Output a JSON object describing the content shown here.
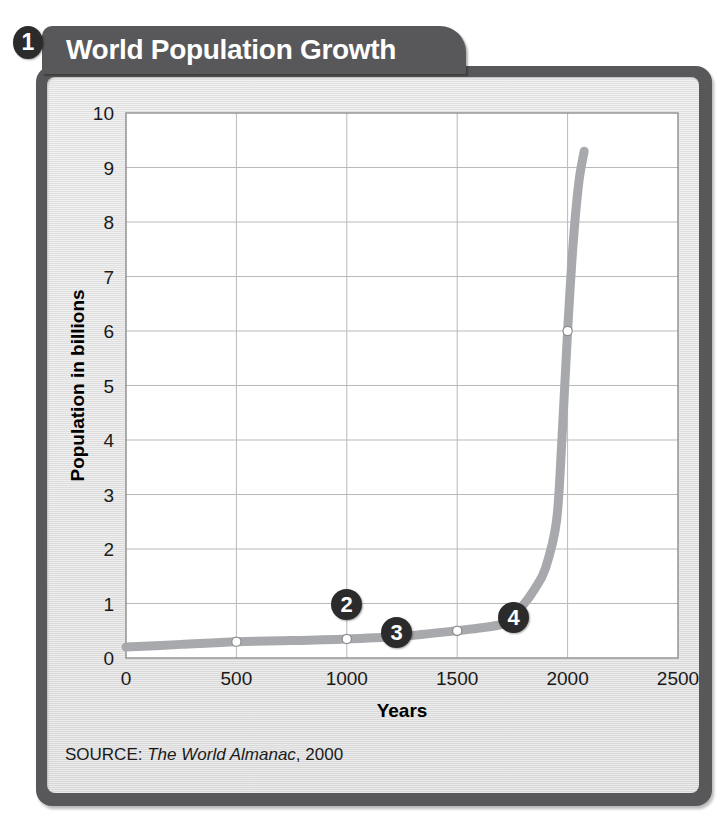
{
  "figure": {
    "number_badge": "1",
    "title": "World Population Growth",
    "source_prefix": "SOURCE:",
    "source_title": "The World Almanac",
    "source_year": "2000",
    "colors": {
      "tab_background": "#58585a",
      "card_border": "#58585a",
      "card_fill": "#e4e4e4",
      "plot_fill": "#ffffff",
      "grid": "#b9b9b9",
      "line": "#a7a9ac",
      "badge": "#2b2b2b",
      "text": "#1a1a1a"
    }
  },
  "callouts": [
    {
      "label": "2",
      "x_year": 1000,
      "y_pop": 1.1
    },
    {
      "label": "3",
      "x_year": 1210,
      "y_pop": 0.62
    },
    {
      "label": "4",
      "x_year": 1790,
      "y_pop": 0.95
    }
  ],
  "chart_data": {
    "type": "line",
    "title": "World Population Growth",
    "xlabel": "Years",
    "ylabel": "Population in billions",
    "xlim": [
      0,
      2500
    ],
    "ylim": [
      0,
      10
    ],
    "xticks": [
      0,
      500,
      1000,
      1500,
      2000,
      2500
    ],
    "yticks": [
      0,
      1,
      2,
      3,
      4,
      5,
      6,
      7,
      8,
      9,
      10
    ],
    "xtick_labels": [
      "0",
      "500",
      "1000",
      "1500",
      "2000",
      "2500"
    ],
    "ytick_labels": [
      "0",
      "1",
      "2",
      "3",
      "4",
      "5",
      "6",
      "7",
      "8",
      "9",
      "10"
    ],
    "grid": true,
    "legend": false,
    "series": [
      {
        "name": "World population",
        "x": [
          0,
          250,
          500,
          750,
          1000,
          1250,
          1500,
          1600,
          1700,
          1750,
          1800,
          1850,
          1900,
          1950,
          1975,
          2000,
          2025,
          2050,
          2075
        ],
        "y": [
          0.2,
          0.25,
          0.3,
          0.32,
          0.35,
          0.4,
          0.5,
          0.55,
          0.62,
          0.79,
          0.98,
          1.26,
          1.65,
          2.52,
          4.07,
          6.0,
          7.6,
          8.7,
          9.3
        ]
      }
    ],
    "markers": [
      {
        "x": 500,
        "y": 0.3
      },
      {
        "x": 1000,
        "y": 0.35
      },
      {
        "x": 1500,
        "y": 0.5
      },
      {
        "x": 2000,
        "y": 6.0
      }
    ]
  }
}
